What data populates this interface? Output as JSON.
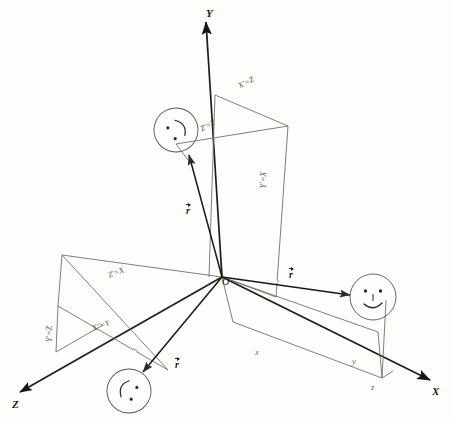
{
  "figure": {
    "type": "hand-drawn-diagram",
    "background_color": "#fdfdfc",
    "ink_color": "#3a3a38",
    "dark_ink_color": "#141414"
  },
  "axes": [
    {
      "id": "y-axis",
      "label": "Y",
      "label_x": 206,
      "label_y": 8
    },
    {
      "id": "x-axis",
      "label": "X",
      "label_x": 432,
      "label_y": 386
    },
    {
      "id": "z-axis",
      "label": "Z",
      "label_x": 12,
      "label_y": 399
    }
  ],
  "origin": {
    "label": "O",
    "x": 222,
    "y": 277
  },
  "prime_labels": [
    {
      "id": "x-prime-eq-z",
      "text": "X'=Z",
      "x": 238,
      "y": 79,
      "rotate": -27
    },
    {
      "id": "z-prime-eq-y",
      "text": "Z'=Y",
      "x": 200,
      "y": 122,
      "rotate": -27
    },
    {
      "id": "y-prime-eq-x",
      "text": "Y'=X",
      "x": 256,
      "y": 176,
      "rotate": -90
    },
    {
      "id": "z-prime-eq-x",
      "text": "Z'=X",
      "x": 108,
      "y": 269,
      "rotate": -21
    },
    {
      "id": "x-dprime-eq-y",
      "text": "X''=Y",
      "x": 92,
      "y": 322,
      "rotate": -21
    },
    {
      "id": "y-prime-eq-z",
      "text": "Y'=Z",
      "x": 42,
      "y": 330,
      "rotate": -90
    }
  ],
  "component_labels": [
    {
      "id": "component-x",
      "text": "x",
      "x": 255,
      "y": 348
    },
    {
      "id": "component-y",
      "text": "y",
      "x": 352,
      "y": 357
    },
    {
      "id": "component-z",
      "text": "z",
      "x": 371,
      "y": 383
    }
  ],
  "vectors": [
    {
      "id": "vector-r-upper-left",
      "label": "r",
      "x": 186,
      "y": 204
    },
    {
      "id": "vector-r-right",
      "label": "r",
      "x": 289,
      "y": 268
    },
    {
      "id": "vector-r-lower-left",
      "label": "r",
      "x": 175,
      "y": 358
    }
  ],
  "faces": [
    {
      "id": "face-upper-left",
      "cx": 176,
      "cy": 130,
      "r": 22,
      "rotation": -120,
      "expression": "tilted-smile"
    },
    {
      "id": "face-right",
      "cx": 373,
      "cy": 297,
      "r": 23,
      "rotation": 0,
      "expression": "smile"
    },
    {
      "id": "face-lower-left",
      "cx": 129,
      "cy": 391,
      "r": 22,
      "rotation": 120,
      "expression": "tilted-smile"
    }
  ]
}
